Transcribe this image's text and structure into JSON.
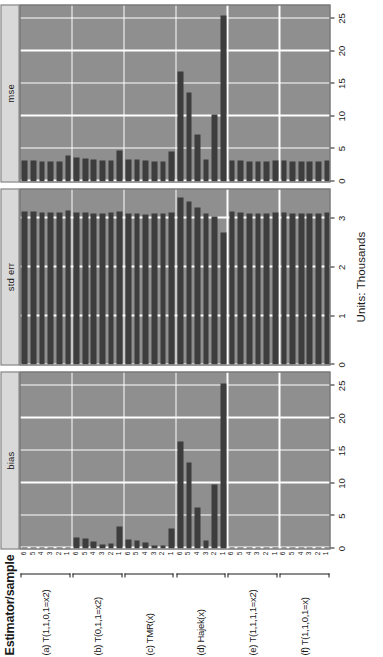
{
  "axis_left": {
    "title": "Estimator/sample",
    "estimators": [
      {
        "label": "(a) T(1,1,0,1=x2)"
      },
      {
        "label": "(b) T(0,1,1=x2)"
      },
      {
        "label": "(c) TMR(x)"
      },
      {
        "label": "(d) Hajek(x)"
      },
      {
        "label": "(e) T(1,1,1,1=x2)"
      },
      {
        "label": "(f) T(1,1,0,1=x)"
      }
    ],
    "sample_ticks": [
      "6",
      "5",
      "4",
      "3",
      "2",
      "1"
    ]
  },
  "units_caption": "Units: Thousands",
  "colors": {
    "bar": "#3d3d3d",
    "panel_background": "#8f8f8f",
    "strip_background": "#d9d9d9",
    "gridline": "#ffffff",
    "page_background": "#ffffff"
  },
  "chart_data": {
    "type": "bar",
    "title": "",
    "subtitle": "",
    "xlabel": "Units: Thousands",
    "ylabel": "Estimator/sample",
    "grid": true,
    "legend_position": "none",
    "orientation": "horizontal",
    "layout": "3 panels side by side, 6 estimator groups x 6 samples each",
    "panels": [
      {
        "name": "bias",
        "xlim": [
          0,
          27
        ],
        "ticks": [
          0,
          5,
          10,
          15,
          20,
          25
        ],
        "ticklabels": [
          "0",
          "5",
          "10",
          "15",
          "20",
          "25"
        ],
        "groups": [
          {
            "estimator": "(a) T(1,1,0,1=x2)",
            "samples": [
              "6",
              "5",
              "4",
              "3",
              "2",
              "1"
            ],
            "values": [
              0.1,
              0.1,
              0.1,
              0.1,
              0.1,
              0.1
            ]
          },
          {
            "estimator": "(b) T(0,1,1=x2)",
            "samples": [
              "6",
              "5",
              "4",
              "3",
              "2",
              "1"
            ],
            "values": [
              1.7,
              1.5,
              1.0,
              0.6,
              0.8,
              3.4
            ]
          },
          {
            "estimator": "(c) TMR(x)",
            "samples": [
              "6",
              "5",
              "4",
              "3",
              "2",
              "1"
            ],
            "values": [
              1.4,
              1.2,
              0.9,
              0.5,
              0.4,
              3.1
            ]
          },
          {
            "estimator": "(d) Hajek(x)",
            "samples": [
              "6",
              "5",
              "4",
              "3",
              "2",
              "1"
            ],
            "values": [
              16.4,
              13.2,
              6.3,
              1.3,
              9.8,
              25.4
            ]
          },
          {
            "estimator": "(e) T(1,1,1,1=x2)",
            "samples": [
              "6",
              "5",
              "4",
              "3",
              "2",
              "1"
            ],
            "values": [
              0.1,
              0.1,
              0.1,
              0.1,
              0.1,
              0.1
            ]
          },
          {
            "estimator": "(f) T(1,1,0,1=x)",
            "samples": [
              "6",
              "5",
              "4",
              "3",
              "2",
              "1"
            ],
            "values": [
              0.1,
              0.1,
              0.1,
              0.1,
              0.1,
              0.1
            ]
          }
        ]
      },
      {
        "name": "std err",
        "xlim": [
          0,
          3.6
        ],
        "ticks": [
          0,
          1,
          2,
          3
        ],
        "ticklabels": [
          "0",
          "1",
          "2",
          "3"
        ],
        "groups": [
          {
            "estimator": "(a) T(1,1,0,1=x2)",
            "samples": [
              "6",
              "5",
              "4",
              "3",
              "2",
              "1"
            ],
            "values": [
              3.15,
              3.15,
              3.13,
              3.13,
              3.12,
              3.16
            ]
          },
          {
            "estimator": "(b) T(0,1,1=x2)",
            "samples": [
              "6",
              "5",
              "4",
              "3",
              "2",
              "1"
            ],
            "values": [
              3.12,
              3.12,
              3.1,
              3.11,
              3.12,
              3.14
            ]
          },
          {
            "estimator": "(c) TMR(x)",
            "samples": [
              "6",
              "5",
              "4",
              "3",
              "2",
              "1"
            ],
            "values": [
              3.1,
              3.1,
              3.09,
              3.1,
              3.11,
              3.13
            ]
          },
          {
            "estimator": "(d) Hajek(x)",
            "samples": [
              "6",
              "5",
              "4",
              "3",
              "2",
              "1"
            ],
            "values": [
              3.42,
              3.34,
              3.22,
              3.1,
              3.05,
              2.72
            ]
          },
          {
            "estimator": "(e) T(1,1,1,1=x2)",
            "samples": [
              "6",
              "5",
              "4",
              "3",
              "2",
              "1"
            ],
            "values": [
              3.14,
              3.12,
              3.11,
              3.11,
              3.11,
              3.12
            ]
          },
          {
            "estimator": "(f) T(1,1,0,1=x)",
            "samples": [
              "6",
              "5",
              "4",
              "3",
              "2",
              "1"
            ],
            "values": [
              3.12,
              3.11,
              3.1,
              3.1,
              3.11,
              3.13
            ]
          }
        ]
      },
      {
        "name": "mse",
        "xlim": [
          0,
          27
        ],
        "ticks": [
          0,
          5,
          10,
          15,
          20,
          25
        ],
        "ticklabels": [
          "0",
          "5",
          "10",
          "15",
          "20",
          "25"
        ],
        "groups": [
          {
            "estimator": "(a) T(1,1,0,1=x2)",
            "samples": [
              "6",
              "5",
              "4",
              "3",
              "2",
              "1"
            ],
            "values": [
              3.2,
              3.2,
              3.1,
              3.1,
              3.1,
              3.9
            ]
          },
          {
            "estimator": "(b) T(0,1,1=x2)",
            "samples": [
              "6",
              "5",
              "4",
              "3",
              "2",
              "1"
            ],
            "values": [
              3.6,
              3.5,
              3.3,
              3.2,
              3.2,
              4.7
            ]
          },
          {
            "estimator": "(c) TMR(x)",
            "samples": [
              "6",
              "5",
              "4",
              "3",
              "2",
              "1"
            ],
            "values": [
              3.4,
              3.3,
              3.2,
              3.1,
              3.1,
              4.6
            ]
          },
          {
            "estimator": "(d) Hajek(x)",
            "samples": [
              "6",
              "5",
              "4",
              "3",
              "2",
              "1"
            ],
            "values": [
              16.8,
              13.6,
              7.1,
              3.3,
              10.3,
              25.5
            ]
          },
          {
            "estimator": "(e) T(1,1,1,1=x2)",
            "samples": [
              "6",
              "5",
              "4",
              "3",
              "2",
              "1"
            ],
            "values": [
              3.2,
              3.2,
              3.1,
              3.1,
              3.1,
              3.2
            ]
          },
          {
            "estimator": "(f) T(1,1,0,1=x)",
            "samples": [
              "6",
              "5",
              "4",
              "3",
              "2",
              "1"
            ],
            "values": [
              3.2,
              3.1,
              3.1,
              3.1,
              3.1,
              3.2
            ]
          }
        ]
      }
    ]
  }
}
